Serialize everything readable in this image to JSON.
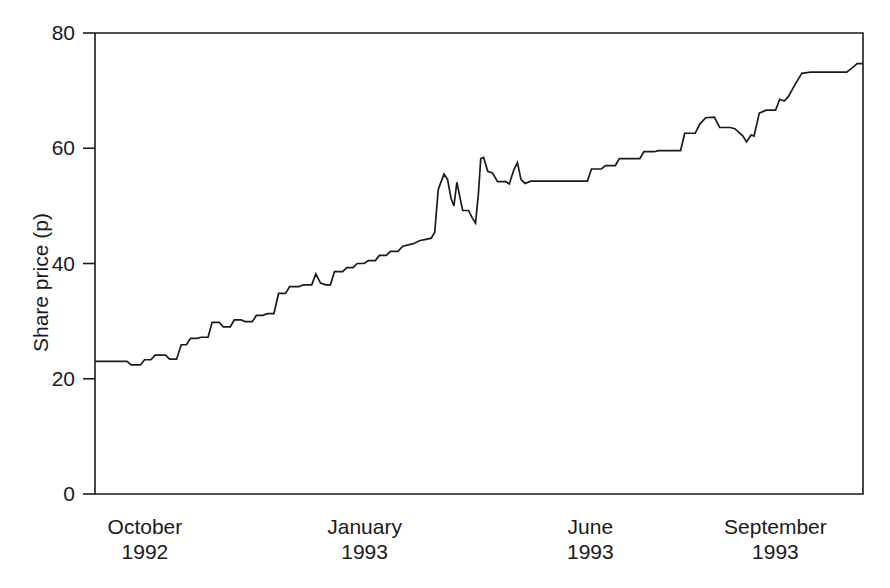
{
  "figure": {
    "background_color": "#ffffff",
    "line_color": "#1a1a1a",
    "axis_color": "#1a1a1a",
    "caption_sliver": ". . ."
  },
  "axes": {
    "y_title": "Share price (p)",
    "y_ticks": [
      "0",
      "20",
      "40",
      "60",
      "80"
    ],
    "x_ticks": [
      {
        "month": "October",
        "year": "1992"
      },
      {
        "month": "January",
        "year": "1993"
      },
      {
        "month": "June",
        "year": "1993"
      },
      {
        "month": "September",
        "year": "1993"
      }
    ]
  },
  "chart_data": {
    "type": "line",
    "title": "",
    "xlabel": "",
    "ylabel": "Share price (p)",
    "ylim": [
      0,
      80
    ],
    "yticks": [
      0,
      20,
      40,
      60,
      80
    ],
    "grid": false,
    "legend": "none",
    "x_axis_type": "date",
    "x_tick_labels": [
      "October\n1992",
      "January\n1993",
      "June\n1993",
      "September\n1993"
    ],
    "x_tick_positions": [
      0.065,
      0.351,
      0.645,
      0.886
    ],
    "series": [
      {
        "name": "Share price",
        "units": "pence",
        "color": "#1a1a1a",
        "points": [
          {
            "x": 0.0,
            "y": 23.0
          },
          {
            "x": 0.028,
            "y": 23.0
          },
          {
            "x": 0.055,
            "y": 23.0
          },
          {
            "x": 0.062,
            "y": 22.4
          },
          {
            "x": 0.078,
            "y": 22.4
          },
          {
            "x": 0.085,
            "y": 23.3
          },
          {
            "x": 0.096,
            "y": 23.3
          },
          {
            "x": 0.103,
            "y": 24.1
          },
          {
            "x": 0.121,
            "y": 24.1
          },
          {
            "x": 0.128,
            "y": 23.4
          },
          {
            "x": 0.14,
            "y": 23.4
          },
          {
            "x": 0.148,
            "y": 25.9
          },
          {
            "x": 0.157,
            "y": 25.9
          },
          {
            "x": 0.164,
            "y": 27.0
          },
          {
            "x": 0.175,
            "y": 27.0
          },
          {
            "x": 0.182,
            "y": 27.2
          },
          {
            "x": 0.194,
            "y": 27.2
          },
          {
            "x": 0.201,
            "y": 29.8
          },
          {
            "x": 0.213,
            "y": 29.8
          },
          {
            "x": 0.22,
            "y": 29.0
          },
          {
            "x": 0.232,
            "y": 29.0
          },
          {
            "x": 0.239,
            "y": 30.2
          },
          {
            "x": 0.251,
            "y": 30.2
          },
          {
            "x": 0.258,
            "y": 29.9
          },
          {
            "x": 0.27,
            "y": 29.9
          },
          {
            "x": 0.277,
            "y": 31.0
          },
          {
            "x": 0.288,
            "y": 31.0
          },
          {
            "x": 0.296,
            "y": 31.3
          },
          {
            "x": 0.307,
            "y": 31.3
          },
          {
            "x": 0.315,
            "y": 34.8
          },
          {
            "x": 0.327,
            "y": 34.8
          },
          {
            "x": 0.334,
            "y": 36.0
          },
          {
            "x": 0.35,
            "y": 36.0
          },
          {
            "x": 0.358,
            "y": 36.3
          },
          {
            "x": 0.372,
            "y": 36.3
          },
          {
            "x": 0.379,
            "y": 38.2
          },
          {
            "x": 0.387,
            "y": 36.6
          },
          {
            "x": 0.396,
            "y": 36.3
          },
          {
            "x": 0.404,
            "y": 36.3
          },
          {
            "x": 0.411,
            "y": 38.6
          },
          {
            "x": 0.425,
            "y": 38.6
          },
          {
            "x": 0.432,
            "y": 39.3
          },
          {
            "x": 0.443,
            "y": 39.3
          },
          {
            "x": 0.45,
            "y": 40.0
          },
          {
            "x": 0.462,
            "y": 40.0
          },
          {
            "x": 0.469,
            "y": 40.5
          },
          {
            "x": 0.481,
            "y": 40.5
          },
          {
            "x": 0.488,
            "y": 41.4
          },
          {
            "x": 0.5,
            "y": 41.4
          },
          {
            "x": 0.507,
            "y": 42.1
          },
          {
            "x": 0.52,
            "y": 42.1
          },
          {
            "x": 0.528,
            "y": 43.0
          },
          {
            "x": 0.545,
            "y": 43.4
          },
          {
            "x": 0.558,
            "y": 44.0
          },
          {
            "x": 0.568,
            "y": 44.2
          },
          {
            "x": 0.577,
            "y": 44.4
          },
          {
            "x": 0.583,
            "y": 45.4
          },
          {
            "x": 0.589,
            "y": 52.8
          },
          {
            "x": 0.594,
            "y": 54.2
          },
          {
            "x": 0.599,
            "y": 55.5
          },
          {
            "x": 0.605,
            "y": 54.6
          },
          {
            "x": 0.611,
            "y": 51.3
          },
          {
            "x": 0.616,
            "y": 50.0
          },
          {
            "x": 0.621,
            "y": 54.1
          },
          {
            "x": 0.626,
            "y": 51.6
          },
          {
            "x": 0.631,
            "y": 49.2
          },
          {
            "x": 0.641,
            "y": 49.2
          },
          {
            "x": 0.647,
            "y": 48.0
          },
          {
            "x": 0.653,
            "y": 47.0
          },
          {
            "x": 0.658,
            "y": 52.1
          },
          {
            "x": 0.662,
            "y": 58.2
          },
          {
            "x": 0.667,
            "y": 58.4
          },
          {
            "x": 0.674,
            "y": 56.0
          },
          {
            "x": 0.682,
            "y": 55.7
          },
          {
            "x": 0.691,
            "y": 54.2
          },
          {
            "x": 0.705,
            "y": 54.2
          },
          {
            "x": 0.711,
            "y": 53.8
          },
          {
            "x": 0.719,
            "y": 56.3
          },
          {
            "x": 0.725,
            "y": 57.5
          },
          {
            "x": 0.731,
            "y": 54.6
          },
          {
            "x": 0.738,
            "y": 53.9
          },
          {
            "x": 0.748,
            "y": 54.3
          },
          {
            "x": 0.8,
            "y": 54.3
          },
          {
            "x": 0.845,
            "y": 54.3
          },
          {
            "x": 0.852,
            "y": 56.4
          },
          {
            "x": 0.869,
            "y": 56.4
          },
          {
            "x": 0.876,
            "y": 57.0
          },
          {
            "x": 0.893,
            "y": 57.0
          },
          {
            "x": 0.9,
            "y": 58.2
          },
          {
            "x": 0.935,
            "y": 58.2
          },
          {
            "x": 0.942,
            "y": 59.4
          },
          {
            "x": 0.96,
            "y": 59.4
          },
          {
            "x": 0.967,
            "y": 59.6
          },
          {
            "x": 1.005,
            "y": 59.6
          },
          {
            "x": 1.012,
            "y": 62.6
          },
          {
            "x": 1.03,
            "y": 62.6
          },
          {
            "x": 1.038,
            "y": 64.2
          },
          {
            "x": 1.048,
            "y": 65.3
          },
          {
            "x": 1.063,
            "y": 65.4
          },
          {
            "x": 1.072,
            "y": 63.6
          },
          {
            "x": 1.09,
            "y": 63.6
          },
          {
            "x": 1.098,
            "y": 63.4
          },
          {
            "x": 1.112,
            "y": 62.1
          },
          {
            "x": 1.118,
            "y": 61.1
          },
          {
            "x": 1.126,
            "y": 62.3
          },
          {
            "x": 1.131,
            "y": 62.1
          },
          {
            "x": 1.14,
            "y": 66.1
          },
          {
            "x": 1.152,
            "y": 66.6
          },
          {
            "x": 1.168,
            "y": 66.6
          },
          {
            "x": 1.175,
            "y": 68.5
          },
          {
            "x": 1.183,
            "y": 68.2
          },
          {
            "x": 1.19,
            "y": 69.0
          },
          {
            "x": 1.201,
            "y": 71.0
          },
          {
            "x": 1.213,
            "y": 73.0
          },
          {
            "x": 1.228,
            "y": 73.2
          },
          {
            "x": 1.29,
            "y": 73.2
          },
          {
            "x": 1.3,
            "y": 74.0
          },
          {
            "x": 1.308,
            "y": 74.7
          },
          {
            "x": 1.318,
            "y": 74.7
          }
        ]
      }
    ]
  }
}
